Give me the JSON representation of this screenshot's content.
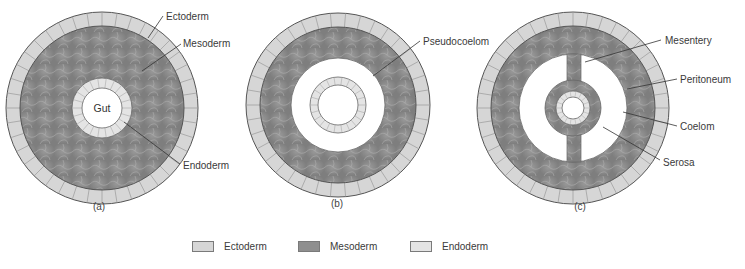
{
  "colors": {
    "ectoderm": "#d6d6d6",
    "mesoderm": "#8f8f8f",
    "endoderm": "#e4e4e4",
    "outline": "#555555",
    "cavity": "#ffffff",
    "label_line": "#333333"
  },
  "diagrams": [
    {
      "id": "a",
      "caption": "(a)",
      "center_label": "Gut",
      "labels": [
        "Ectoderm",
        "Mesoderm",
        "Endoderm"
      ]
    },
    {
      "id": "b",
      "caption": "(b)",
      "labels": [
        "Pseudocoelom"
      ]
    },
    {
      "id": "c",
      "caption": "(c)",
      "labels": [
        "Mesentery",
        "Peritoneum",
        "Coelom",
        "Serosa"
      ]
    }
  ],
  "legend": [
    {
      "label": "Ectoderm",
      "color": "#d6d6d6"
    },
    {
      "label": "Mesoderm",
      "color": "#8f8f8f"
    },
    {
      "label": "Endoderm",
      "color": "#e4e4e4"
    }
  ]
}
